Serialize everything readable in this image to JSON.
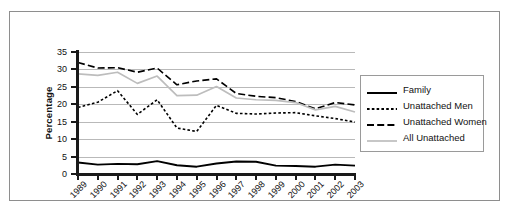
{
  "chart_data": {
    "type": "line",
    "title": "",
    "subtitle": "",
    "xlabel": "",
    "ylabel": "Percentage",
    "xlim": [
      1989,
      2003
    ],
    "ylim": [
      0,
      35
    ],
    "yticks": [
      0,
      5,
      10,
      15,
      20,
      25,
      30,
      35
    ],
    "grid": true,
    "legend_position": "right",
    "x": [
      1989,
      1990,
      1991,
      1992,
      1993,
      1994,
      1995,
      1996,
      1997,
      1998,
      1999,
      2000,
      2001,
      2002,
      2003
    ],
    "categories": [
      "1989",
      "1990",
      "1991",
      "1992",
      "1993",
      "1994",
      "1995",
      "1996",
      "1997",
      "1998",
      "1999",
      "2000",
      "2001",
      "2002",
      "2003"
    ],
    "series": [
      {
        "name": "Family",
        "style": "solid",
        "color": "#000000",
        "values": [
          3.3,
          2.7,
          2.9,
          2.8,
          3.7,
          2.5,
          2.1,
          3.0,
          3.6,
          3.5,
          2.4,
          2.3,
          2.1,
          2.7,
          2.4
        ]
      },
      {
        "name": "Unattached Men",
        "style": "dotted",
        "color": "#000000",
        "values": [
          19.1,
          20.6,
          23.9,
          17.1,
          21.3,
          13.2,
          12.2,
          19.7,
          17.4,
          17.2,
          17.5,
          17.6,
          16.7,
          15.9,
          14.9
        ]
      },
      {
        "name": "Unattached Women",
        "style": "dashed",
        "color": "#000000",
        "values": [
          32.0,
          30.4,
          30.5,
          29.2,
          30.4,
          25.6,
          26.7,
          27.3,
          23.1,
          22.3,
          21.9,
          20.8,
          18.7,
          20.5,
          19.8
        ]
      },
      {
        "name": "All Unattached",
        "style": "solid",
        "color": "#bdbdbd",
        "values": [
          28.7,
          28.3,
          29.2,
          26.0,
          28.1,
          22.5,
          22.6,
          25.1,
          21.8,
          21.3,
          21.1,
          20.5,
          18.4,
          19.4,
          17.8
        ]
      }
    ]
  },
  "legend": {
    "items": [
      {
        "label": "Family"
      },
      {
        "label": "Unattached Men"
      },
      {
        "label": "Unattached Women"
      },
      {
        "label": "All Unattached"
      }
    ]
  }
}
